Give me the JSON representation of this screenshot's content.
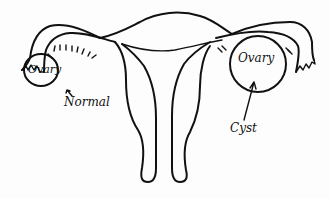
{
  "diagram": {
    "stroke_color": "#111111",
    "background_color": "#fdfdfd",
    "left_ovary": {
      "label": "Ovary",
      "annotation": "Normal"
    },
    "right_ovary": {
      "label": "Ovary",
      "annotation": "Cyst"
    }
  }
}
